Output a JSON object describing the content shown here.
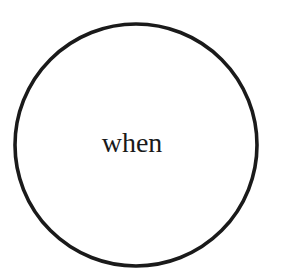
{
  "canvas": {
    "width": 281,
    "height": 276,
    "background_color": "#ffffff"
  },
  "diagram": {
    "type": "single-node-circle",
    "title": "when",
    "stroke_color": "#1a1a1a",
    "fill_color": "#ffffff",
    "text_color": "#1a1a1a",
    "nodes": [
      {
        "id": "node-when",
        "shape": "circle",
        "label": "when",
        "center_x": 136,
        "center_y": 145,
        "radius": 121,
        "stroke_width": 3.6,
        "stroke_color": "#1a1a1a",
        "fill_color": "#ffffff",
        "label_color": "#1a1a1a",
        "label_font_size": 28,
        "label_center_x": 132,
        "label_center_y": 143
      }
    ],
    "edges": []
  }
}
